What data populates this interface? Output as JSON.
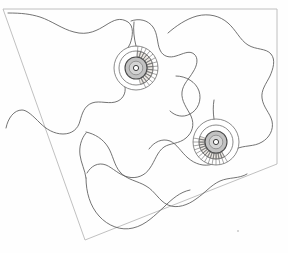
{
  "figure": {
    "background_color": "#ffffff",
    "frame_color": "#b9b9b9",
    "grain_line_color": "#5a5a5a",
    "rosette_core_color": "#c2c2c2",
    "wedge_color": "#ebe7e2",
    "width": 288,
    "height": 253
  },
  "frame": {
    "name": "quadrilateral-frame",
    "points": "3,9 277,9 277,164 85,240"
  },
  "grain_outlines": [
    {
      "id": "grain-left",
      "name": "left-amoeboid-grain",
      "path": "M 8,13 C 22,13 30,14 40,17 C 52,21 62,29 74,32 C 88,36 98,30 106,25 C 114,20 120,17 128,22 C 134,26 133,36 130,44 C 126,52 120,57 118,63 C 116,70 121,76 124,83 C 127,91 124,98 118,101 C 110,105 100,100 92,103 C 84,106 82,114 80,121 C 78,129 72,134 63,134 C 54,134 46,129 40,123 C 33,116 27,110 22,110 C 14,110 8,118 6,128"
    },
    {
      "id": "grain-center",
      "name": "central-vertical-grain",
      "path": "M 131,21 C 139,18 148,20 153,27 C 158,34 157,44 160,50 C 163,57 170,58 176,56 C 183,54 189,50 194,54 C 199,58 197,66 193,72 C 189,79 183,84 182,92 C 181,101 187,108 191,116 C 195,125 192,133 186,138 C 179,144 170,143 164,147 C 157,152 155,161 150,168 C 145,176 136,179 128,177 C 119,175 113,168 106,165 C 98,162 91,166 87,173"
    },
    {
      "id": "grain-right",
      "name": "right-amoeboid-grain",
      "path": "M 168,33 C 176,26 186,19 197,16 C 209,13 220,16 228,23 C 236,30 240,40 248,45 C 256,50 266,48 271,54 C 276,60 273,69 270,76 C 266,84 261,90 262,98 C 263,107 270,113 272,121 C 274,130 269,138 262,142 C 254,147 244,145 236,149 C 227,153 222,161 213,164 C 204,167 195,164 188,158 C 181,152 177,144 170,141 C 162,138 154,142 149,149"
    },
    {
      "id": "grain-bottom",
      "name": "lower-lobe-grain",
      "path": "M 86,132 C 95,134 103,139 108,147 C 113,155 114,165 120,172 C 127,180 138,181 146,186 C 155,191 159,201 168,205 C 177,209 188,205 196,199 C 205,193 211,185 220,181 C 229,177 239,179 247,174"
    },
    {
      "id": "grain-bottom-curve",
      "name": "bottom-boundary-curve",
      "path": "M 86,178 C 86,192 90,206 99,216 C 108,226 121,231 133,228 C 146,225 155,215 164,207 C 172,199 180,192 190,190"
    },
    {
      "id": "grain-left-lower",
      "name": "left-lower-boundary",
      "path": "M 86,133 C 81,139 79,147 80,155 C 81,163 85,170 86,178"
    },
    {
      "id": "grain-inner-loop",
      "name": "inner-lens-loop",
      "path": "M 176,76 C 186,76 196,82 199,91 C 202,100 198,110 190,114 C 183,118 175,116 170,111"
    }
  ],
  "rosettes": [
    {
      "id": "rosette-upper-left",
      "name": "upper-left-rosette",
      "cx": 136,
      "cy": 68,
      "r_outer": 22,
      "r_ring": 17,
      "r_disk": 11,
      "r_core": 2.6,
      "spoke_count": 14,
      "wedge_start_deg": 5,
      "wedge_end_deg": 165,
      "tail_path": "M 136,46 C 134,38 133,30 134,22"
    },
    {
      "id": "rosette-lower-right",
      "name": "lower-right-rosette",
      "cx": 216,
      "cy": 142,
      "r_outer": 23,
      "r_ring": 17,
      "r_disk": 11,
      "r_core": 2.6,
      "spoke_count": 14,
      "wedge_start_deg": 150,
      "wedge_end_deg": 290,
      "tail_path": "M 214,119 C 213,112 213,106 214,100"
    }
  ],
  "specks": [
    {
      "name": "stray-speck",
      "cx": 238,
      "cy": 231,
      "r": 1.0
    }
  ]
}
